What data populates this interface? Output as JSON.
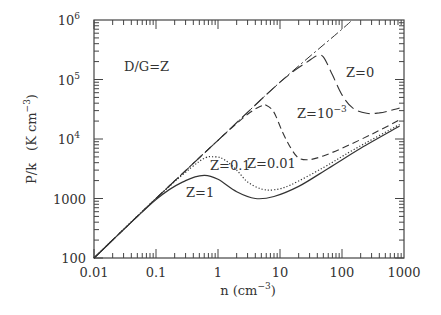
{
  "chart_data": {
    "type": "line",
    "title": "",
    "xlabel": "n (cm^-3)",
    "ylabel": "P/k (K cm^-3)",
    "xscale": "log",
    "yscale": "log",
    "xlim": [
      0.01,
      1000
    ],
    "ylim": [
      100,
      1000000
    ],
    "x_ticks": [
      "0.01",
      "0.1",
      "1",
      "10",
      "100",
      "1000"
    ],
    "y_ticks": [
      {
        "base": "100",
        "exp": ""
      },
      {
        "base": "1000",
        "exp": ""
      },
      {
        "base": "10",
        "exp": "4"
      },
      {
        "base": "10",
        "exp": "5"
      },
      {
        "base": "10",
        "exp": "6"
      }
    ],
    "grid": false,
    "annotations": [
      {
        "text": "D/G=Z"
      }
    ],
    "series": [
      {
        "name": "Z=0",
        "label_base": "Z=0",
        "label_exp": "",
        "style": "dash-dot",
        "points": [
          [
            0.01,
            100
          ],
          [
            0.1,
            1000
          ],
          [
            1,
            9500
          ],
          [
            10,
            90000
          ],
          [
            100,
            700000
          ],
          [
            145,
            1000000
          ]
        ]
      },
      {
        "name": "Z=10^-3",
        "label_base": "Z=10",
        "label_exp": "-3",
        "style": "long-dash",
        "points": [
          [
            0.01,
            100
          ],
          [
            0.1,
            1000
          ],
          [
            1,
            9500
          ],
          [
            10,
            90000
          ],
          [
            30,
            210000
          ],
          [
            40,
            250000
          ],
          [
            50,
            240000
          ],
          [
            70,
            120000
          ],
          [
            100,
            55000
          ],
          [
            150,
            33000
          ],
          [
            250,
            27000
          ],
          [
            400,
            27500
          ],
          [
            600,
            30000
          ],
          [
            850,
            33000
          ]
        ]
      },
      {
        "name": "Z=0.01",
        "label_base": "Z=0.01",
        "label_exp": "",
        "style": "dash",
        "points": [
          [
            0.01,
            100
          ],
          [
            0.1,
            1000
          ],
          [
            1,
            9500
          ],
          [
            3,
            26000
          ],
          [
            5,
            36000
          ],
          [
            6,
            37000
          ],
          [
            8,
            28000
          ],
          [
            11,
            13000
          ],
          [
            15,
            7000
          ],
          [
            20,
            4800
          ],
          [
            30,
            4500
          ],
          [
            50,
            5200
          ],
          [
            100,
            7000
          ],
          [
            300,
            12000
          ],
          [
            850,
            21000
          ]
        ]
      },
      {
        "name": "Z=0.1",
        "label_base": "Z=0.1",
        "label_exp": "",
        "style": "dotted",
        "points": [
          [
            0.01,
            100
          ],
          [
            0.1,
            1000
          ],
          [
            0.5,
            4200
          ],
          [
            0.9,
            5000
          ],
          [
            1.3,
            4400
          ],
          [
            2,
            3000
          ],
          [
            3,
            1900
          ],
          [
            5,
            1450
          ],
          [
            8,
            1400
          ],
          [
            15,
            1700
          ],
          [
            50,
            3300
          ],
          [
            150,
            6500
          ],
          [
            850,
            17500
          ]
        ]
      },
      {
        "name": "Z=1",
        "label_base": "Z=1",
        "label_exp": "",
        "style": "solid",
        "points": [
          [
            0.01,
            100
          ],
          [
            0.1,
            960
          ],
          [
            0.3,
            2000
          ],
          [
            0.6,
            2450
          ],
          [
            1,
            2100
          ],
          [
            2,
            1300
          ],
          [
            4,
            1000
          ],
          [
            8,
            1080
          ],
          [
            20,
            1600
          ],
          [
            60,
            3200
          ],
          [
            200,
            7000
          ],
          [
            850,
            16500
          ]
        ]
      }
    ]
  },
  "labels": {
    "dg": "D/G=Z",
    "z0": "Z=0",
    "z1e3_base": "Z=10",
    "z1e3_exp": "−3",
    "z001": "Z=0.01",
    "z01": "Z=0.1",
    "z1": "Z=1",
    "ylabel_main": "P/k",
    "ylabel_unit_pre": "(K cm",
    "ylabel_unit_exp": "−3",
    "ylabel_unit_post": ")",
    "xlabel_pre": "n (cm",
    "xlabel_exp": "−3",
    "xlabel_post": ")"
  }
}
